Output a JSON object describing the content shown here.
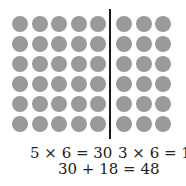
{
  "diagram": {
    "dot_color": "#9a9a9a",
    "left_group": {
      "columns": 5,
      "rows": 6
    },
    "right_group": {
      "columns": 3,
      "rows": 6
    },
    "equations": {
      "left": "5 × 6 = 30",
      "right": "3 × 6 = 18",
      "total": "30 + 18 = 48"
    }
  }
}
